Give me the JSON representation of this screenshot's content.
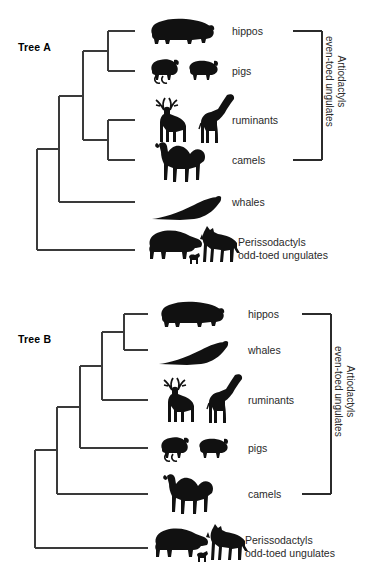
{
  "figure": {
    "type": "phylogenetic-cladogram-pair",
    "background_color": "#ffffff",
    "line_color": "#3a3a3a",
    "silhouette_color": "#111111",
    "text_color": "#2a2a2a"
  },
  "trees": [
    {
      "id": "tree-a",
      "title": "Tree A",
      "tips": [
        {
          "key": "hippos",
          "label": "hippos",
          "silhouettes": [
            "hippo"
          ]
        },
        {
          "key": "pigs",
          "label": "pigs",
          "silhouettes": [
            "boar",
            "pig"
          ]
        },
        {
          "key": "ruminants",
          "label": "ruminants",
          "silhouettes": [
            "deer",
            "giraffe"
          ]
        },
        {
          "key": "camels",
          "label": "camels",
          "silhouettes": [
            "camel"
          ]
        },
        {
          "key": "whales",
          "label": "whales",
          "silhouettes": [
            "whale"
          ]
        },
        {
          "key": "perissodactyls",
          "label": "Perissodactyls",
          "label_line2": "odd-toed ungulates",
          "silhouettes": [
            "rhino",
            "foal",
            "zebra"
          ]
        }
      ],
      "clade_bracket": {
        "label_line1": "Artiodactyls",
        "label_line2": "even-toed ungulates",
        "spans_tips": [
          "hippos",
          "camels"
        ]
      },
      "topology": "(((hippos,pigs),(ruminants,camels)),whales),perissodactyls"
    },
    {
      "id": "tree-b",
      "title": "Tree B",
      "tips": [
        {
          "key": "hippos",
          "label": "hippos",
          "silhouettes": [
            "hippo"
          ]
        },
        {
          "key": "whales",
          "label": "whales",
          "silhouettes": [
            "whale"
          ]
        },
        {
          "key": "ruminants",
          "label": "ruminants",
          "silhouettes": [
            "deer",
            "giraffe"
          ]
        },
        {
          "key": "pigs",
          "label": "pigs",
          "silhouettes": [
            "boar",
            "pig"
          ]
        },
        {
          "key": "camels",
          "label": "camels",
          "silhouettes": [
            "camel"
          ]
        },
        {
          "key": "perissodactyls",
          "label": "Perissodactyls",
          "label_line2": "odd-toed ungulates",
          "silhouettes": [
            "rhino",
            "foal",
            "zebra"
          ]
        }
      ],
      "clade_bracket": {
        "label_line1": "Artiodactyls",
        "label_line2": "even-toed ungulates",
        "spans_tips": [
          "hippos",
          "camels"
        ]
      },
      "topology": "((((hippos,whales),ruminants),pigs),camels),perissodactyls"
    }
  ]
}
